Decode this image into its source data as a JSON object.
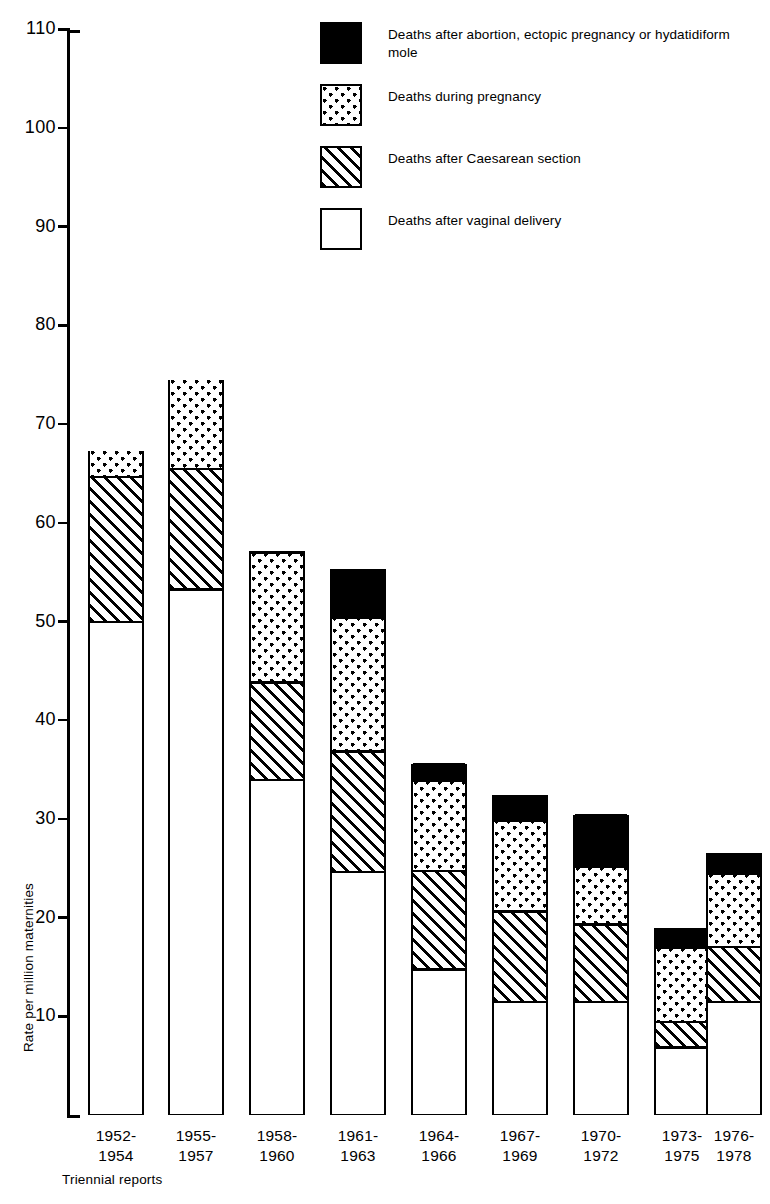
{
  "chart_data": {
    "type": "bar",
    "subtype": "stacked-bar",
    "title": "",
    "xlabel": "Triennial reports",
    "ylabel": "Rate per million maternities",
    "ylim": [
      0,
      110
    ],
    "ytick_step": 10,
    "yticks": [
      110,
      100,
      90,
      80,
      70,
      60,
      50,
      40,
      30,
      20,
      10
    ],
    "ytick_labels": [
      "110",
      "100",
      "90",
      "80",
      "70",
      "60",
      "50",
      "40",
      "30",
      "20",
      "10"
    ],
    "grid": false,
    "legend_position": "top-right",
    "categories": [
      "1952-\n1954",
      "1955-\n1957",
      "1958-\n1960",
      "1961-\n1963",
      "1964-\n1966",
      "1967-\n1969",
      "1970-\n1972",
      "1973-\n1975",
      "1976-\n1978"
    ],
    "category_lines": [
      [
        "1952-",
        "1954"
      ],
      [
        "1955-",
        "1957"
      ],
      [
        "1958-",
        "1960"
      ],
      [
        "1961-",
        "1963"
      ],
      [
        "1964-",
        "1966"
      ],
      [
        "1967-",
        "1969"
      ],
      [
        "1970-",
        "1972"
      ],
      [
        "1973-",
        "1975"
      ],
      [
        "1976-",
        "1978"
      ]
    ],
    "series": [
      {
        "name": "Deaths after vaginal delivery",
        "pattern": "white",
        "values": [
          50.0,
          53.3,
          34.0,
          24.7,
          14.8,
          11.5,
          11.5,
          6.9,
          11.5
        ]
      },
      {
        "name": "Deaths after Caesarean section",
        "pattern": "hatch",
        "values": [
          14.7,
          12.2,
          9.9,
          12.2,
          10.0,
          9.2,
          7.9,
          2.6,
          5.6
        ]
      },
      {
        "name": "Deaths during pregnancy",
        "pattern": "dots",
        "values": [
          2.6,
          9.0,
          13.1,
          13.6,
          9.1,
          9.2,
          5.8,
          7.5,
          7.4
        ]
      },
      {
        "name": "Deaths after abortion, ectopic pregnancy or hydatidiform mole",
        "pattern": "solid",
        "values": [
          0.0,
          0.0,
          0.0,
          4.8,
          1.7,
          2.5,
          5.2,
          1.9,
          2.0
        ]
      }
    ],
    "cumulative_tops": [
      67.3,
      74.5,
      57.1,
      55.3,
      35.6,
      32.4,
      30.4,
      18.9,
      26.5
    ]
  },
  "legend": {
    "items": [
      {
        "pattern": "solid",
        "label": "Deaths after abortion, ectopic pregnancy or hydatidiform mole"
      },
      {
        "pattern": "dots",
        "label": "Deaths during pregnancy"
      },
      {
        "pattern": "hatch",
        "label": "Deaths after Caesarean section"
      },
      {
        "pattern": "white",
        "label": "Deaths after vaginal delivery"
      }
    ]
  },
  "axes": {
    "y_title": "Rate per million maternities",
    "x_title": "Triennial reports"
  },
  "colors": {
    "ink": "#000000",
    "paper": "#ffffff"
  }
}
